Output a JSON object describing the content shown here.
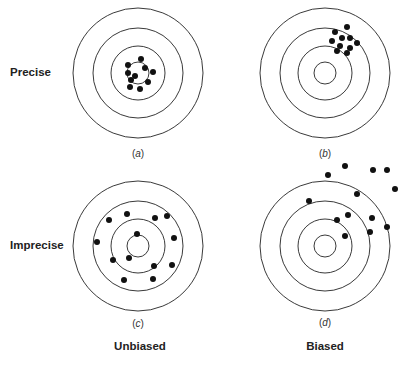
{
  "row_labels": {
    "precise": "Precise",
    "imprecise": "Imprecise"
  },
  "col_labels": {
    "unbiased": "Unbiased",
    "biased": "Biased"
  },
  "colors": {
    "ring": "#3a3a3a",
    "dot": "#111111",
    "background": "#ffffff"
  },
  "ring_radii": [
    11,
    27,
    45,
    65
  ],
  "targets": [
    {
      "id": "a",
      "caption_open": "(",
      "caption_letter": "a",
      "caption_close": ")",
      "center": [
        138,
        73
      ],
      "dots": [
        [
          128,
          65
        ],
        [
          141,
          59
        ],
        [
          145,
          68
        ],
        [
          153,
          72
        ],
        [
          128,
          73
        ],
        [
          135,
          76
        ],
        [
          131,
          80
        ],
        [
          148,
          82
        ],
        [
          130,
          87
        ],
        [
          140,
          89
        ]
      ]
    },
    {
      "id": "b",
      "caption_open": "(",
      "caption_letter": "b",
      "caption_close": ")",
      "center": [
        325,
        73
      ],
      "dots": [
        [
          347,
          27
        ],
        [
          335,
          32
        ],
        [
          342,
          38
        ],
        [
          350,
          38
        ],
        [
          332,
          41
        ],
        [
          357,
          43
        ],
        [
          340,
          46
        ],
        [
          350,
          48
        ],
        [
          337,
          51
        ],
        [
          347,
          53
        ]
      ]
    },
    {
      "id": "c",
      "caption_open": "(",
      "caption_letter": "c",
      "caption_close": ")",
      "center": [
        138,
        246
      ],
      "dots": [
        [
          127,
          214
        ],
        [
          109,
          220
        ],
        [
          155,
          218
        ],
        [
          167,
          216
        ],
        [
          137,
          234
        ],
        [
          174,
          238
        ],
        [
          97,
          242
        ],
        [
          129,
          258
        ],
        [
          113,
          260
        ],
        [
          154,
          266
        ],
        [
          172,
          265
        ],
        [
          124,
          280
        ],
        [
          153,
          279
        ]
      ]
    },
    {
      "id": "d",
      "caption_open": "(",
      "caption_letter": "d",
      "caption_close": ")",
      "center": [
        325,
        246
      ],
      "dots": [
        [
          345,
          166
        ],
        [
          373,
          170
        ],
        [
          387,
          170
        ],
        [
          328,
          175
        ],
        [
          395,
          189
        ],
        [
          357,
          194
        ],
        [
          309,
          201
        ],
        [
          348,
          215
        ],
        [
          372,
          218
        ],
        [
          337,
          220
        ],
        [
          387,
          227
        ],
        [
          370,
          232
        ],
        [
          345,
          236
        ]
      ]
    }
  ]
}
